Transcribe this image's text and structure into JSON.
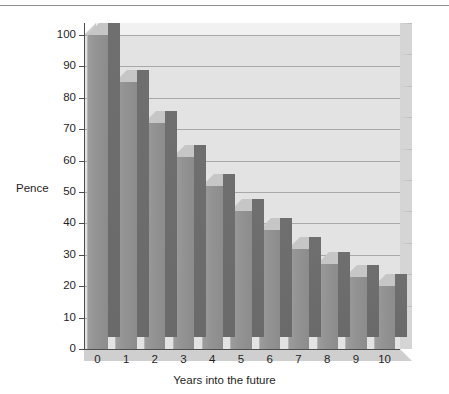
{
  "figure": {
    "annotation_pound": "£1"
  },
  "chart_data": {
    "type": "bar",
    "title": "",
    "subtitle": "",
    "xlabel": "Years into the future",
    "ylabel": "Pence",
    "categories": [
      "0",
      "1",
      "2",
      "3",
      "4",
      "5",
      "6",
      "7",
      "8",
      "9",
      "10"
    ],
    "values": [
      100,
      85,
      72,
      61,
      52,
      44,
      38,
      32,
      27,
      23,
      20
    ],
    "ylim": [
      0,
      100
    ],
    "ytick_labels": [
      "0",
      "10",
      "20",
      "30",
      "40",
      "50",
      "60",
      "70",
      "80",
      "90",
      "100"
    ],
    "ytick_values": [
      0,
      10,
      20,
      30,
      40,
      50,
      60,
      70,
      80,
      90,
      100
    ],
    "xtick_labels": [
      "0",
      "1",
      "2",
      "3",
      "4",
      "5",
      "6",
      "7",
      "8",
      "9",
      "10"
    ],
    "grid": "horizontal",
    "legend": "none",
    "annotations": [
      {
        "text": "£1",
        "category": "0",
        "value": 100
      }
    ],
    "style": {
      "bar_face_color": "#939393",
      "bar_top_color": "#c6c6c6",
      "bar_side_color": "#6f6f6f",
      "plot_background": "#e3e3e3",
      "gridline_color": "#a8a8a8",
      "axis_color": "#4d4d4d",
      "text_color": "#1f1f1f",
      "annotation_text_color": "#ffffff"
    }
  }
}
